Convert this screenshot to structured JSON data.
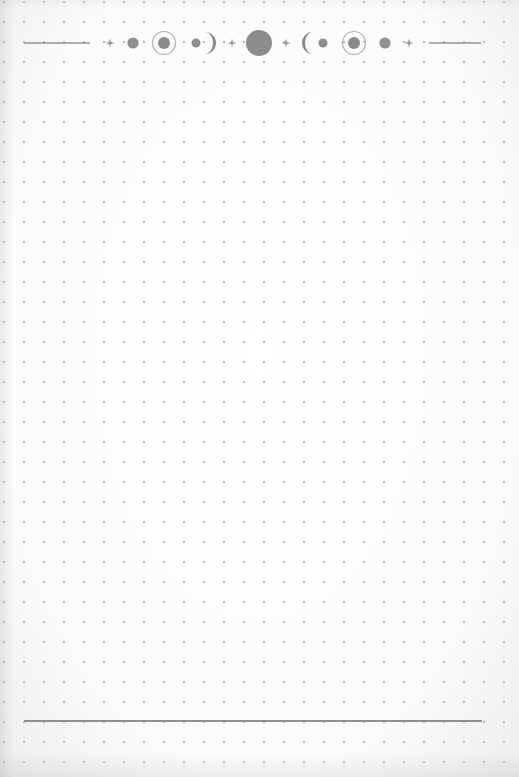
{
  "page": {
    "type": "dot-grid notebook page",
    "background_color": "#ffffff",
    "grid": {
      "spacing_px": 20,
      "dot_color": "#b9b9b9"
    }
  },
  "header": {
    "decoration": "moon-phase divider",
    "color": "#8a8a8a",
    "elements": [
      {
        "kind": "line",
        "name": "left-rule"
      },
      {
        "kind": "icon",
        "name": "sparkle-icon"
      },
      {
        "kind": "icon",
        "name": "new-moon-dot-icon"
      },
      {
        "kind": "icon",
        "name": "ringed-moon-icon"
      },
      {
        "kind": "icon",
        "name": "waxing-crescent-icon"
      },
      {
        "kind": "icon",
        "name": "sparkle-icon"
      },
      {
        "kind": "icon",
        "name": "full-moon-icon"
      },
      {
        "kind": "icon",
        "name": "sparkle-icon"
      },
      {
        "kind": "icon",
        "name": "waning-crescent-icon"
      },
      {
        "kind": "icon",
        "name": "ringed-moon-icon"
      },
      {
        "kind": "icon",
        "name": "new-moon-dot-icon"
      },
      {
        "kind": "icon",
        "name": "sparkle-icon"
      },
      {
        "kind": "line",
        "name": "right-rule"
      }
    ]
  },
  "footer": {
    "rule_color": "#8e8e8e"
  }
}
